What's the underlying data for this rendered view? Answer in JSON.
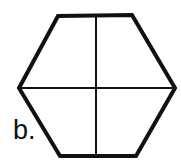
{
  "figure": {
    "label": "b.",
    "shape": "hexagon",
    "divisions": "hexagon divided into four parts by one vertical and one horizontal line",
    "stroke_color": "#111111",
    "fill_color": "#ffffff"
  }
}
